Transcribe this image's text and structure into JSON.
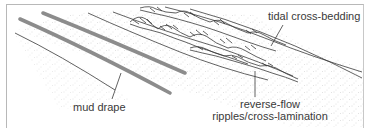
{
  "diagram": {
    "type": "geological cross-section sketch",
    "labels": {
      "tidal_cross_bedding": "tidal cross-bedding",
      "mud_drape": "mud drape",
      "reverse_flow_line1": "reverse-flow",
      "reverse_flow_line2": "ripples/cross-lamination"
    },
    "colors": {
      "mud_drape": "#8c8c8c",
      "line": "#3a3a3a",
      "stipple": "#b5b5b5",
      "frame": "#b8b8b8",
      "text": "#3a3a3a"
    }
  }
}
